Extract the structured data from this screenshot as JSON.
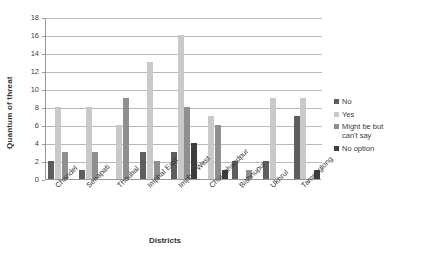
{
  "chart_data": {
    "type": "bar",
    "title": "",
    "xlabel": "Districts",
    "ylabel": "Quantum of threat",
    "ylim": [
      0,
      18
    ],
    "ytick_step": 2,
    "yticks": [
      0,
      2,
      4,
      6,
      8,
      10,
      12,
      14,
      16,
      18
    ],
    "grid": true,
    "legend_position": "right",
    "categories": [
      "Chandel",
      "Senapati",
      "Thoubal",
      "Imphal East",
      "Imphal West",
      "Churachandpur",
      "Bishnupur",
      "Ukhrul",
      "Tamenglong"
    ],
    "series": [
      {
        "name": "No",
        "color": "#5e5e5e",
        "values": [
          2,
          1,
          0,
          3,
          3,
          0,
          2,
          2,
          7
        ]
      },
      {
        "name": "Yes",
        "color": "#c9c9c9",
        "values": [
          8,
          8,
          6,
          13,
          16,
          7,
          0,
          9,
          9
        ]
      },
      {
        "name": "Might be but can't say",
        "color": "#8f8f8f",
        "values": [
          3,
          3,
          9,
          2,
          8,
          6,
          1,
          0,
          0
        ]
      },
      {
        "name": "No option",
        "color": "#3d3d3d",
        "values": [
          0,
          0,
          0,
          0,
          4,
          1,
          0,
          0,
          1
        ]
      }
    ]
  }
}
